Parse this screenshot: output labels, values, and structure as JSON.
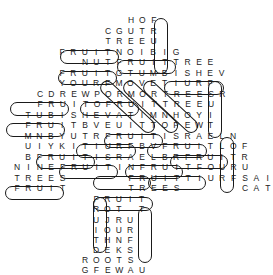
{
  "puzzle": {
    "type": "word-search",
    "cell_w": 11.4,
    "rows": [
      {
        "y": 20,
        "x": 131,
        "text": "HOF"
      },
      {
        "y": 31,
        "x": 108,
        "text": "CGUTR"
      },
      {
        "y": 41,
        "x": 108,
        "text": "TREEU"
      },
      {
        "y": 52,
        "x": 62,
        "text": "FRUITNOIBIG"
      },
      {
        "y": 62,
        "x": 85,
        "text": "NUTFRUITTREE"
      },
      {
        "y": 73,
        "x": 62,
        "text": "FRUITGTUMBISHEV"
      },
      {
        "y": 83,
        "x": 62,
        "text": "YOURFMOVETIURF"
      },
      {
        "y": 94,
        "x": 40,
        "text": "CDREWPORMORTREESR"
      },
      {
        "y": 104,
        "x": 40,
        "text": "FRUITOFRUITTREEU"
      },
      {
        "y": 115,
        "x": 28,
        "text": "TUBISHEVATIMNHOYI"
      },
      {
        "y": 125,
        "x": 28,
        "text": "FRUITBVEUITTOPEWT"
      },
      {
        "y": 136,
        "x": 28,
        "text": "MNBYUTRFRUITISRAELN"
      },
      {
        "y": 146,
        "x": 28,
        "text": "UIYKITIURFBVFRUITLOF"
      },
      {
        "y": 157,
        "x": 28,
        "text": "BFRUITISRAELBRFRUITR"
      },
      {
        "y": 167,
        "x": 17,
        "text": "NINEFRUITINFRUITFOURU"
      },
      {
        "y": 178,
        "x": 17,
        "text": "TREES     FRUITTIURFSAI"
      },
      {
        "y": 188,
        "x": 17,
        "text": "FRUIT     TREES     CAT"
      },
      {
        "y": 199,
        "x": 96,
        "text": "FRUIT"
      },
      {
        "y": 209,
        "x": 96,
        "text": "ROT T"
      },
      {
        "y": 220,
        "x": 96,
        "text": "UJRU"
      },
      {
        "y": 230,
        "x": 96,
        "text": "IOUR"
      },
      {
        "y": 240,
        "x": 96,
        "text": "THNF"
      },
      {
        "y": 250,
        "x": 96,
        "text": "DEKS"
      },
      {
        "y": 260,
        "x": 85,
        "text": "ROOTS"
      },
      {
        "y": 270,
        "x": 85,
        "text": "GFEWAU"
      }
    ],
    "found_words": [
      {
        "word": "FRUIT",
        "dir": "down",
        "x": 154,
        "y": 18,
        "w": 14,
        "h": 56
      },
      {
        "word": "FRUIT",
        "dir": "right",
        "x": 60,
        "y": 50,
        "w": 59,
        "h": 14
      },
      {
        "word": "FRUIT",
        "dir": "right",
        "x": 117,
        "y": 60,
        "w": 59,
        "h": 14
      },
      {
        "word": "FRUIT",
        "dir": "right",
        "x": 58,
        "y": 71,
        "w": 59,
        "h": 14
      },
      {
        "word": "TIURF",
        "dir": "right",
        "x": 164,
        "y": 81,
        "w": 60,
        "h": 14
      },
      {
        "word": "FRUIT",
        "dir": "down",
        "x": 208,
        "y": 81,
        "w": 14,
        "h": 57
      },
      {
        "word": "FRUIT",
        "dir": "right",
        "x": 10,
        "y": 102,
        "w": 59,
        "h": 14
      },
      {
        "word": "FRUIT",
        "dir": "right",
        "x": 80,
        "y": 102,
        "w": 59,
        "h": 14
      },
      {
        "word": "FRUIT",
        "dir": "right",
        "x": 6,
        "y": 123,
        "w": 59,
        "h": 14
      },
      {
        "word": "FRUIT",
        "dir": "right",
        "x": 104,
        "y": 134,
        "w": 59,
        "h": 14
      },
      {
        "word": "TIURF",
        "dir": "right",
        "x": 76,
        "y": 144,
        "w": 60,
        "h": 14
      },
      {
        "word": "FRUIT",
        "dir": "right",
        "x": 147,
        "y": 144,
        "w": 60,
        "h": 14
      },
      {
        "word": "FRUIT",
        "dir": "down",
        "x": 220,
        "y": 137,
        "w": 14,
        "h": 56
      },
      {
        "word": "FRUIT",
        "dir": "right",
        "x": 36,
        "y": 155,
        "w": 59,
        "h": 14
      },
      {
        "word": "FRUIT",
        "dir": "right",
        "x": 170,
        "y": 155,
        "w": 58,
        "h": 14
      },
      {
        "word": "FRUIT",
        "dir": "right",
        "x": 59,
        "y": 165,
        "w": 59,
        "h": 14
      },
      {
        "word": "FRUIT",
        "dir": "right",
        "x": 125,
        "y": 165,
        "w": 58,
        "h": 14
      },
      {
        "word": "FRUIT",
        "dir": "right",
        "x": 93,
        "y": 176,
        "w": 58,
        "h": 14
      },
      {
        "word": "TIURF",
        "dir": "right",
        "x": 148,
        "y": 176,
        "w": 58,
        "h": 14
      },
      {
        "word": "FRUIT",
        "dir": "right",
        "x": 5,
        "y": 186,
        "w": 59,
        "h": 14
      },
      {
        "word": "FRUIT",
        "dir": "right",
        "x": 93,
        "y": 197,
        "w": 60,
        "h": 14
      },
      {
        "word": "FRUIT",
        "dir": "down",
        "x": 93,
        "y": 197,
        "w": 14,
        "h": 56
      },
      {
        "word": "TIURF",
        "dir": "down",
        "x": 138,
        "y": 207,
        "w": 14,
        "h": 56
      }
    ],
    "diagonal_loops": [
      {
        "x": 102,
        "y": 83,
        "len": 70,
        "angle": 43
      },
      {
        "x": 125,
        "y": 83,
        "len": 70,
        "angle": 43
      },
      {
        "x": 145,
        "y": 83,
        "len": 70,
        "angle": 43
      }
    ]
  }
}
